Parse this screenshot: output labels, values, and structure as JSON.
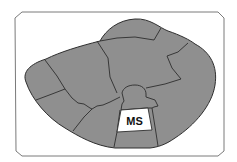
{
  "diagram": {
    "title": "",
    "labels": {
      "highlighted_region": "MS"
    },
    "colors": {
      "background": "#ffffff",
      "frame_stroke": "#7a7a7a",
      "region_fill": "#8f8f8f",
      "region_stroke": "#2e2e2e",
      "highlight_fill": "#ffffff",
      "label_color": "#111111"
    },
    "regions": [
      {
        "id": "far-left",
        "highlighted": false
      },
      {
        "id": "upper-left",
        "highlighted": false
      },
      {
        "id": "top",
        "highlighted": false
      },
      {
        "id": "upper-center",
        "highlighted": false
      },
      {
        "id": "right",
        "highlighted": false
      },
      {
        "id": "lower-left",
        "highlighted": false
      },
      {
        "id": "lower-center-left",
        "highlighted": false
      },
      {
        "id": "central-knob",
        "highlighted": false
      },
      {
        "id": "ms",
        "label": "MS",
        "highlighted": true
      },
      {
        "id": "bottom-center",
        "highlighted": false
      },
      {
        "id": "lower-right",
        "highlighted": false
      }
    ]
  }
}
